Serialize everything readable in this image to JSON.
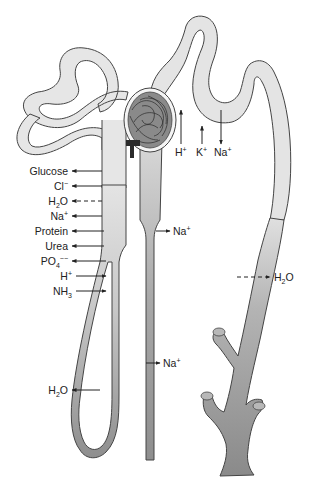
{
  "colors": {
    "tubule_light": "#e6e6e6",
    "tubule_mid": "#c4c4c4",
    "tubule_dark": "#9a9a9a",
    "outline": "#444444",
    "glomerulus": "#6a6a6a",
    "capsule": "#f4f4f4",
    "arrow": "#222222"
  },
  "labels": {
    "proximal": [
      {
        "base": "Glucose",
        "sub": "",
        "sup": "",
        "direction": "out",
        "style": "solid"
      },
      {
        "base": "Cl",
        "sub": "",
        "sup": "−",
        "direction": "out",
        "style": "solid"
      },
      {
        "base": "H",
        "sub": "2",
        "tail": "O",
        "sup": "",
        "direction": "out",
        "style": "dashed"
      },
      {
        "base": "Na",
        "sub": "",
        "sup": "+",
        "direction": "out",
        "style": "solid"
      },
      {
        "base": "Protein",
        "sub": "",
        "sup": "",
        "direction": "out",
        "style": "solid"
      },
      {
        "base": "Urea",
        "sub": "",
        "sup": "",
        "direction": "out",
        "style": "solid"
      },
      {
        "base": "PO",
        "sub": "4",
        "sup": "−−",
        "direction": "out",
        "style": "solid"
      },
      {
        "base": "H",
        "sub": "",
        "sup": "+",
        "direction": "in",
        "style": "solid"
      },
      {
        "base": "NH",
        "sub": "3",
        "sup": "",
        "direction": "in",
        "style": "solid"
      }
    ],
    "distal": [
      {
        "base": "H",
        "sup": "+",
        "direction": "in"
      },
      {
        "base": "K",
        "sup": "+",
        "direction": "in"
      },
      {
        "base": "Na",
        "sup": "+",
        "direction": "out"
      }
    ],
    "ascending_thick": {
      "base": "Na",
      "sup": "+",
      "direction": "out"
    },
    "ascending_thin": {
      "base": "Na",
      "sup": "+",
      "direction": "out"
    },
    "descending_limb": {
      "base": "H",
      "sub": "2",
      "tail": "O",
      "direction": "out"
    },
    "collecting_duct": {
      "base": "H",
      "sub": "2",
      "tail": "O",
      "direction": "out",
      "style": "dashed"
    }
  }
}
